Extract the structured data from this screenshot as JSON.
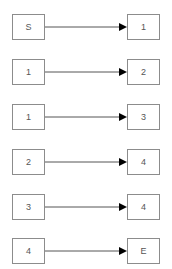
{
  "diagram": {
    "edges": [
      {
        "from": "S",
        "to": "1"
      },
      {
        "from": "1",
        "to": "2"
      },
      {
        "from": "1",
        "to": "3"
      },
      {
        "from": "2",
        "to": "4"
      },
      {
        "from": "3",
        "to": "4"
      },
      {
        "from": "4",
        "to": "E"
      }
    ]
  },
  "colors": {
    "border": "#8c8c8c",
    "line": "#555555",
    "arrowhead": "#000000",
    "text": "#555555"
  }
}
